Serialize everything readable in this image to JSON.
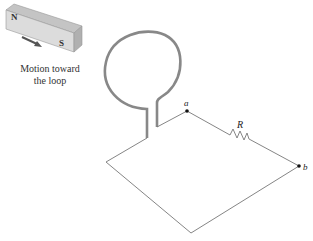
{
  "magnet": {
    "north_label": "N",
    "south_label": "S",
    "motion_caption_line1": "Motion toward",
    "motion_caption_line2": "the loop"
  },
  "circuit": {
    "point_a_label": "a",
    "point_b_label": "b",
    "resistor_label": "R"
  },
  "colors": {
    "magnet_face": "#d9d9d9",
    "magnet_top": "#bdbdbd",
    "loop_wire": "#7a7a7a",
    "circuit_wire": "#777777",
    "arrow": "#555555"
  }
}
